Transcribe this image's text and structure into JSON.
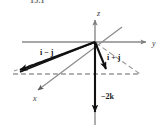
{
  "figure": {
    "caption": "15.1",
    "background_color": "#ffffff"
  },
  "colors": {
    "axis": "#8a8a8a",
    "dashed": "#8a8a8a",
    "vector": "#111111",
    "thin_vector": "#4a4a4a",
    "label_text": "#1a1a1a",
    "axis_label_text": "#3a3a3a"
  },
  "axes": [
    {
      "name": "z-axis",
      "label": "z",
      "direction": "up"
    },
    {
      "name": "y-axis",
      "label": "y",
      "direction": "right"
    },
    {
      "name": "x-axis",
      "label": "x",
      "direction": "lower-left"
    }
  ],
  "vectors": [
    {
      "name": "vector-i-minus-j",
      "label": "i − j",
      "style": "thick-solid"
    },
    {
      "name": "vector-i-plus-j",
      "label": "i + j",
      "style": "thick-solid"
    },
    {
      "name": "vector-minus-2k",
      "label": "−2k",
      "style": "thick-solid"
    }
  ],
  "label_positions": {
    "z": {
      "x": 97,
      "y": 13
    },
    "y": {
      "x": 152,
      "y": 45
    },
    "x": {
      "x": 37,
      "y": 97
    },
    "i_minus_j": {
      "x": 45,
      "y": 52
    },
    "i_plus_j": {
      "x": 108,
      "y": 57
    },
    "minus_2k": {
      "x": 102,
      "y": 96
    }
  },
  "geometry": {
    "origin": {
      "x": 95,
      "y": 42
    },
    "resultant_tip": {
      "x": 12,
      "y": 73
    },
    "i_plus_j_tip": {
      "x": 107,
      "y": 72
    },
    "minus_2k_tip": {
      "x": 95,
      "y": 118
    }
  }
}
